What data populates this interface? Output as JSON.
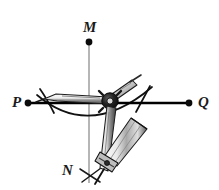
{
  "figure": {
    "background_color": "#ffffff",
    "width": 219,
    "height": 190,
    "labels": {
      "M": "M",
      "N": "N",
      "P": "P",
      "Q": "Q"
    },
    "colors": {
      "ink": "#111111",
      "line_pq": "#000000",
      "line_mn": "#9a9a9a",
      "top_rule": "#9a9a9a",
      "arc": "#111111",
      "compass_body": "#f2f2f2",
      "compass_outline": "#1a1a1a",
      "compass_shading": "#8c8c8c",
      "pivot": "#151515"
    },
    "geometry": {
      "line_pq": {
        "x1": 27,
        "y1": 103,
        "x2": 190,
        "y2": 103,
        "label_left": "P",
        "label_right": "Q"
      },
      "line_mn": {
        "x1": 89,
        "y1": 41,
        "x2": 89,
        "y2": 182,
        "label_top": "M",
        "label_bottom": "N"
      },
      "point_M": {
        "x": 89,
        "y": 41
      },
      "point_P": {
        "x": 27,
        "y": 103
      },
      "point_Q": {
        "x": 190,
        "y": 103
      },
      "compass_pivot": {
        "x": 110,
        "y": 101
      },
      "compass_tip": {
        "x": 105,
        "y": 172
      },
      "main_arc": {
        "start_x": 38,
        "start_y": 96,
        "end_x": 150,
        "end_y": 88,
        "sag_y": 132
      },
      "arc_cross_left": {
        "x": 48,
        "y": 103
      },
      "arc_cross_right": {
        "x": 142,
        "y": 101
      },
      "arc_cross_bottom": {
        "x": 89,
        "y": 175
      }
    },
    "top_rule": {
      "y": 6,
      "x1": 0,
      "x2": 219
    }
  }
}
